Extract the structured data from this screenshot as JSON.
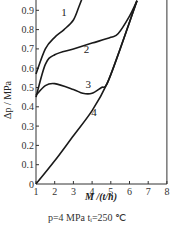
{
  "chart_data": {
    "type": "line",
    "title": "",
    "xlabel": "M /(t/h)",
    "ylabel": "Δp / MPa",
    "xlim": [
      1,
      8
    ],
    "ylim": [
      0,
      0.95
    ],
    "x_ticks": [
      "1",
      "2",
      "3",
      "4",
      "5",
      "6",
      "7",
      "8"
    ],
    "y_ticks": [
      "0",
      "0.1",
      "0.2",
      "0.3",
      "0.4",
      "0.5",
      "0.6",
      "0.7",
      "0.8",
      "0.9"
    ],
    "grid": false,
    "legend": "inline curve labels 1-4",
    "series": [
      {
        "name": "1",
        "x": [
          1,
          1.5,
          2,
          2.5,
          3,
          3.3,
          3.5
        ],
        "y": [
          0.57,
          0.7,
          0.76,
          0.8,
          0.85,
          0.92,
          0.97
        ]
      },
      {
        "name": "2",
        "x": [
          1,
          1.5,
          2,
          3,
          4,
          5,
          5.4,
          6,
          6.4
        ],
        "y": [
          0.45,
          0.62,
          0.67,
          0.7,
          0.73,
          0.76,
          0.78,
          0.87,
          0.95
        ]
      },
      {
        "name": "3",
        "x": [
          1,
          1.5,
          2,
          3,
          3.5,
          4,
          4.5,
          4.8,
          5.5,
          6.4
        ],
        "y": [
          0.46,
          0.51,
          0.52,
          0.49,
          0.47,
          0.47,
          0.5,
          0.52,
          0.7,
          0.95
        ]
      },
      {
        "name": "4",
        "x": [
          1,
          2,
          3,
          4,
          4.8,
          5.5,
          6.4
        ],
        "y": [
          0.0,
          0.12,
          0.25,
          0.38,
          0.52,
          0.7,
          0.95
        ]
      }
    ],
    "annotations": [
      "p=4 MPa  tₓ=250 ℃"
    ]
  },
  "axes": {
    "xlabel_text": "M /(t/h)",
    "ylabel_text": "Δp / MPa"
  },
  "caption": {
    "conditions": "p=4 MPa   tᵢ=250 ℃"
  },
  "curve_labels": [
    "1",
    "2",
    "3",
    "4"
  ]
}
